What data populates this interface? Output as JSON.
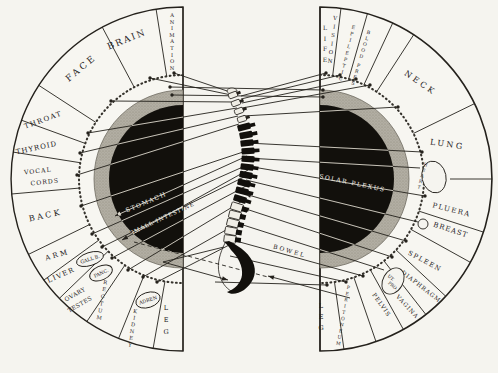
{
  "figure_type": "Spinal nerve zone chart (spine flanked by two labeled half-circle organ fans)",
  "colors": {
    "paper": "#f5f4ef",
    "ink": "#24211c",
    "stipple": "#b2aea3",
    "stipple_dot": "#8e897d",
    "disc": "#12100c",
    "line_on_disc": "#d9d5ca",
    "text_on_disc": "#f1efe6"
  },
  "left_fan": {
    "boundaries": [
      9,
      28,
      57,
      70,
      81,
      95,
      116,
      126,
      134,
      146,
      158,
      170
    ],
    "sectors": [
      {
        "label": "ANIMATION",
        "mode": "stack",
        "x": 172,
        "y": 17,
        "dy": 6.6,
        "fs": 5.2,
        "rot": 0
      },
      {
        "label": "BRAIN",
        "mode": "rot",
        "x": 128,
        "y": 42,
        "rot": -22,
        "fs": 9,
        "ls": 2
      },
      {
        "label": "FACE",
        "mode": "rot",
        "x": 83,
        "y": 70,
        "rot": -40,
        "fs": 9,
        "ls": 3
      },
      {
        "label": "THROAT",
        "mode": "rot",
        "x": 44,
        "y": 122,
        "rot": -20,
        "fs": 7,
        "ls": 1.5
      },
      {
        "label": "THYROID",
        "mode": "rot",
        "x": 37,
        "y": 150,
        "rot": -12,
        "fs": 7,
        "ls": 1
      },
      {
        "label": "VOCAL CORDS",
        "mode": "rot2",
        "lines": [
          "VOCAL",
          "CORDS"
        ],
        "x": 38,
        "y": 173,
        "x2": 45,
        "y2": 184,
        "rot": -6,
        "fs": 6.2,
        "ls": 1
      },
      {
        "label": "BACK",
        "mode": "rot",
        "x": 46,
        "y": 218,
        "rot": -12,
        "fs": 8,
        "ls": 2.5
      },
      {
        "label": "ARM",
        "mode": "rot",
        "x": 58,
        "y": 257,
        "rot": -16,
        "fs": 7,
        "ls": 2.5
      },
      {
        "label": "LIVER",
        "mode": "rot",
        "x": 62,
        "y": 277,
        "rot": -24,
        "fs": 6.8,
        "ls": 1.5
      },
      {
        "label": "OVARY TESTES",
        "mode": "rot2",
        "lines": [
          "OVARY",
          "TESTES"
        ],
        "x": 76,
        "y": 296,
        "x2": 81,
        "y2": 306,
        "rot": -30,
        "fs": 5.8,
        "ls": 0.5
      },
      {
        "label": "RECTUM",
        "mode": "stack",
        "x": 105,
        "y": 284,
        "dy": 7.2,
        "fs": 5.2,
        "rot": 10
      },
      {
        "label": "KIDNEY",
        "mode": "stack",
        "x": 135,
        "y": 313,
        "dy": 6.8,
        "fs": 5.2,
        "rot": 9
      },
      {
        "label": "LEG",
        "mode": "stack",
        "x": 166,
        "y": 310,
        "dy": 12,
        "fs": 6.5,
        "rot": 0
      }
    ],
    "ovals": [
      {
        "label": "GALL B.",
        "cx": 90,
        "cy": 259,
        "rx": 14,
        "ry": 6.5,
        "rot": -18,
        "fs": 4.8,
        "textMode": "inline"
      },
      {
        "label": "PANC.",
        "cx": 101,
        "cy": 273,
        "rx": 12,
        "ry": 7,
        "rot": -24,
        "fs": 4.8,
        "textMode": "inline"
      },
      {
        "label": "ADREN",
        "cx": 148,
        "cy": 300,
        "rx": 12.5,
        "ry": 7.5,
        "rot": -18,
        "fs": 4.8,
        "textMode": "inline"
      }
    ]
  },
  "right_fan": {
    "boundaries": [
      7,
      16,
      25,
      33,
      64,
      90,
      108,
      119,
      133,
      142,
      151,
      161,
      172
    ],
    "sectors": [
      {
        "label": "LIFE",
        "mode": "stack",
        "x": 325,
        "y": 30,
        "dy": 10.5,
        "fs": 6,
        "rot": 0
      },
      {
        "label": "VISION",
        "mode": "stack",
        "x": 335,
        "y": 20,
        "dy": 8.6,
        "fs": 5.4,
        "rot": 7
      },
      {
        "label": "EPILEPTIC",
        "mode": "stack",
        "x": 353,
        "y": 29,
        "dy": 6.6,
        "fs": 4.8,
        "rot": 14
      },
      {
        "label": "BLOOD PRES",
        "mode": "stack",
        "x": 368,
        "y": 34,
        "dy": 6.2,
        "fs": 4.8,
        "rot": 17
      },
      {
        "label": "NECK",
        "mode": "rot",
        "x": 419,
        "y": 85,
        "rot": 35,
        "fs": 8,
        "ls": 3
      },
      {
        "label": "LUNG",
        "mode": "rot",
        "x": 447,
        "y": 147,
        "rot": 8,
        "fs": 8,
        "ls": 2.5
      },
      {
        "label": "PLUERA",
        "mode": "rot",
        "x": 451,
        "y": 212,
        "rot": 14,
        "fs": 7,
        "ls": 1.5
      },
      {
        "label": "BREAST",
        "mode": "rot",
        "x": 450,
        "y": 232,
        "rot": 18,
        "fs": 7,
        "ls": 1
      },
      {
        "label": "SPLEEN",
        "mode": "rot",
        "x": 424,
        "y": 263,
        "rot": 28,
        "fs": 6.5,
        "ls": 1.5
      },
      {
        "label": "DIAPHRAGM",
        "mode": "rot",
        "x": 420,
        "y": 288,
        "rot": 38,
        "fs": 5.8,
        "ls": 1
      },
      {
        "label": "VAGINA",
        "mode": "rot",
        "x": 406,
        "y": 308,
        "rot": 47,
        "fs": 5.8,
        "ls": 1
      },
      {
        "label": "PELVIS",
        "mode": "rot",
        "x": 380,
        "y": 306,
        "rot": 55,
        "fs": 5.8,
        "ls": 1
      },
      {
        "label": "PERITONEUM",
        "mode": "stack",
        "x": 348,
        "y": 289,
        "dy": 6.3,
        "fs": 4.6,
        "rot": 10
      },
      {
        "label": "LEG",
        "mode": "stack",
        "x": 321,
        "y": 308,
        "dy": 11,
        "fs": 6.5,
        "rot": 0
      }
    ],
    "ovals": [
      {
        "label": "HEART",
        "cx": 434,
        "cy": 177,
        "rx": 12,
        "ry": 16,
        "rot": -12,
        "fs": 4.4,
        "textMode": "stack",
        "tx": 425,
        "ty": 166,
        "tdy": 5.8,
        "trot": 16
      },
      {
        "label": "UT. PRO.",
        "lines": [
          "UT.",
          "PRO."
        ],
        "cx": 393,
        "cy": 281,
        "rx": 10,
        "ry": 14,
        "rot": 30,
        "fs": 4.4,
        "textMode": "lines",
        "tx": 390,
        "ty": 279,
        "tx2": 392,
        "ty2": 287,
        "trot": 40
      }
    ]
  },
  "center_labels": [
    {
      "text": "STOMACH",
      "x": 147,
      "y": 204,
      "rot": -23,
      "fs": 6,
      "ls": 1.5
    },
    {
      "text": "SMALL INTESTINE",
      "x": 163,
      "y": 220,
      "rot": -25,
      "fs": 5.5,
      "ls": 1
    },
    {
      "text": "SOLAR PLEXUS",
      "x": 352,
      "y": 185,
      "rot": 12,
      "fs": 6,
      "ls": 1.5
    },
    {
      "text": "BOWEL",
      "x": 289,
      "y": 253,
      "rot": 16,
      "fs": 6,
      "ls": 2
    }
  ],
  "lines": [
    {
      "p": [
        236,
        94,
        174,
        73
      ],
      "dot": "end"
    },
    {
      "p": [
        236,
        96,
        150,
        78
      ],
      "dot": "end"
    },
    {
      "p": [
        236,
        102,
        111,
        101
      ],
      "dot": "end"
    },
    {
      "p": [
        237,
        108,
        88,
        133
      ],
      "dot": "end"
    },
    {
      "p": [
        238,
        116,
        80,
        153
      ],
      "dot": "end"
    },
    {
      "p": [
        239,
        124,
        77,
        175
      ],
      "dot": "end"
    },
    {
      "p": [
        243,
        152,
        81,
        206
      ],
      "dot": "end"
    },
    {
      "p": [
        245,
        166,
        92,
        234
      ],
      "dot": "end"
    },
    {
      "p": [
        246,
        176,
        102,
        247
      ],
      "dot": "end"
    },
    {
      "p": [
        246,
        186,
        112,
        258
      ],
      "dot": "end"
    },
    {
      "p": [
        244,
        200,
        128,
        270
      ],
      "dot": "end"
    },
    {
      "p": [
        240,
        222,
        143,
        277
      ],
      "dot": "end"
    },
    {
      "p": [
        235,
        242,
        157,
        282
      ],
      "dot": "end"
    },
    {
      "p": [
        247,
        156,
        115,
        216
      ],
      "head": "end"
    },
    {
      "p": [
        248,
        170,
        122,
        240
      ],
      "head": "end"
    },
    {
      "p": [
        170,
        87,
        323,
        90
      ],
      "dot": "both"
    },
    {
      "p": [
        172,
        95,
        323,
        97
      ],
      "dot": "both"
    },
    {
      "p": [
        224,
        247,
        163,
        262
      ]
    },
    {
      "p": [
        163,
        262,
        228,
        280
      ],
      "head": "end"
    },
    {
      "p": [
        134,
        242,
        268,
        277
      ],
      "dash": true
    },
    {
      "p": [
        241,
        96,
        326,
        73
      ],
      "dot": "end"
    },
    {
      "p": [
        241,
        99,
        340,
        75
      ],
      "dot": "end"
    },
    {
      "p": [
        242,
        103,
        356,
        79
      ],
      "dot": "end"
    },
    {
      "p": [
        242,
        108,
        370,
        85
      ],
      "dot": "end"
    },
    {
      "p": [
        243,
        116,
        398,
        107
      ],
      "dot": "end"
    },
    {
      "p": [
        247,
        143,
        422,
        152
      ],
      "head": "start",
      "dot": "end"
    },
    {
      "p": [
        247,
        158,
        420,
        168
      ],
      "head": "start"
    },
    {
      "p": [
        247,
        166,
        425,
        196
      ],
      "head": "start",
      "dot": "end"
    },
    {
      "p": [
        246,
        180,
        418,
        222
      ]
    },
    {
      "p": [
        245,
        194,
        406,
        241
      ],
      "head": "start",
      "dot": "end"
    },
    {
      "p": [
        243,
        208,
        392,
        257
      ],
      "head": "start",
      "dot": "end"
    },
    {
      "p": [
        240,
        224,
        384,
        270
      ]
    },
    {
      "p": [
        236,
        241,
        363,
        276
      ],
      "dot": "end"
    },
    {
      "p": [
        230,
        256,
        346,
        282
      ],
      "dot": "end"
    },
    {
      "p": [
        215,
        282,
        327,
        285
      ],
      "dot": "end"
    },
    {
      "p": [
        350,
        298,
        268,
        276
      ],
      "head": "end"
    }
  ],
  "spine": {
    "points": [
      [
        233,
        95
      ],
      [
        236,
        103
      ],
      [
        239,
        111
      ],
      [
        242,
        119
      ],
      [
        244,
        127
      ],
      [
        246,
        135
      ],
      [
        247,
        143
      ],
      [
        248,
        151
      ],
      [
        248,
        159
      ],
      [
        247,
        167
      ],
      [
        246,
        175
      ],
      [
        244,
        183
      ],
      [
        242,
        191
      ],
      [
        240,
        199
      ],
      [
        237,
        207
      ],
      [
        235,
        215
      ],
      [
        233,
        223
      ],
      [
        231,
        231
      ],
      [
        230,
        239
      ]
    ],
    "cervical_count": 4,
    "thoracic_count": 10
  }
}
